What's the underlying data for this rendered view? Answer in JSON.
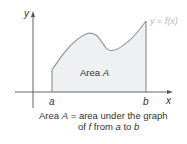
{
  "diagram": {
    "axes": {
      "x_label": "x",
      "y_label": "y"
    },
    "curve_label": "y = f(x)",
    "region_label_prefix": "Area ",
    "region_label_var": "A",
    "bounds": {
      "left": "a",
      "right": "b"
    },
    "caption": {
      "line1_prefix": "Area ",
      "line1_var": "A",
      "line1_rest": " = area under the graph",
      "line2_prefix": "of ",
      "line2_f": "f",
      "line2_mid": " from ",
      "line2_a": "a",
      "line2_to": " to ",
      "line2_b": "b"
    },
    "colors": {
      "fill": "#eef0f2",
      "curve": "#9a9a9a",
      "axis": "#555555",
      "curve_label": "#b8b8b8"
    }
  }
}
